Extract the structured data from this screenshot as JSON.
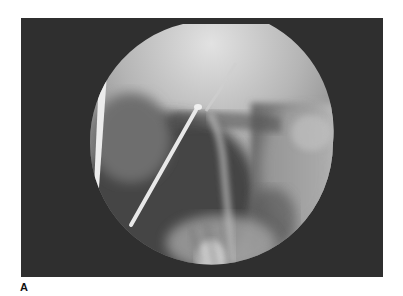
{
  "figure": {
    "panel_label": "A",
    "image_description": "Fluoroscopic image (circular field of view) showing a straight catheter entering from lower left with its tip in a contrast-filled duct, a vertical radiopaque line at left edge",
    "colors": {
      "frame_background": "#2f2f2f",
      "field_bright": "#d9d9d9",
      "field_mid": "#9a9a9a",
      "field_dark": "#4a4a4a",
      "catheter": "#e8e8e8",
      "page_background": "#ffffff"
    }
  }
}
